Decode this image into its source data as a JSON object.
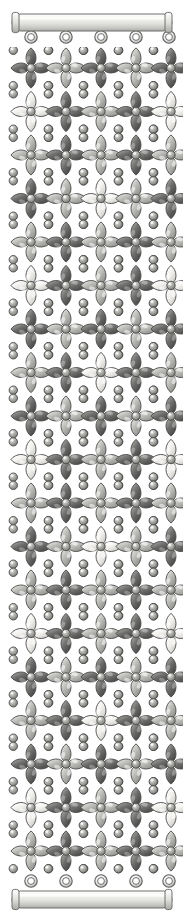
{
  "figure": {
    "background_color": "#ffffff",
    "canvas": {
      "width": 183,
      "height": 922
    }
  },
  "clasp": {
    "type": "tube-bar-clasp",
    "count": 2,
    "positions": [
      "top",
      "bottom"
    ],
    "bar": {
      "label": "clasp-bar",
      "x": 12,
      "width": 160,
      "height": 17,
      "top_y": 14,
      "bottom_y": 891,
      "fill_light": "#f4f4f2",
      "fill_mid": "#dcdcd8",
      "fill_shadow": "#b8b8b4",
      "stroke": "#6f6f6f",
      "end_cap_width": 7
    },
    "rings": {
      "label": "clasp-loop-ring",
      "count": 5,
      "outer_radius": 6.2,
      "inner_radius": 3.4,
      "stroke": "#5f5f5f",
      "fill": "#e9e9e6",
      "x_positions": [
        31,
        66,
        101,
        136,
        169
      ],
      "top_y": 37,
      "bottom_y": 881
    }
  },
  "band": {
    "label": "beadwork-band",
    "top_y": 48,
    "bottom_y": 874,
    "columns": 5,
    "rows": 19,
    "column_pitch": 35,
    "row_pitch": 43.5,
    "first_column_x": 31,
    "first_row_y": 68
  },
  "cluster": {
    "label": "bead-cluster",
    "structure": "four-diamond-rosette",
    "petals_per_cluster": 4,
    "petal_shape": "rounded-rhombus",
    "petal_radius": 12.5,
    "petal_offset": 8.2,
    "center_bead_radius": 4.2,
    "corner_bead_radius": 4.2,
    "stroke": "#4a4a4a",
    "stroke_width": 0.9
  },
  "palette": {
    "light_bead_fill": "#f0efec",
    "light_bead_hilite": "#ffffff",
    "light_bead_shade": "#cfcecb",
    "mid_bead_fill": "#b9b9b6",
    "mid_bead_hilite": "#e4e4e1",
    "mid_bead_shade": "#8e8e8b",
    "dark_bead_fill": "#6e6e6c",
    "dark_bead_hilite": "#a9a9a6",
    "dark_bead_shade": "#474746",
    "seed_bead_fill": "#a3a3a0",
    "seed_bead_stroke": "#4a4a4a",
    "outline": "#4a4a4a"
  },
  "pattern": {
    "description": "Alternating light and dark bead rosettes in a checkerboard rhythm across 5 columns.",
    "row_sequence": [
      [
        "dark",
        "mid",
        "dark",
        "mid",
        "dark"
      ],
      [
        "light",
        "dark",
        "mid",
        "dark",
        "light"
      ],
      [
        "mid",
        "dark",
        "mid",
        "dark",
        "mid"
      ],
      [
        "dark",
        "mid",
        "light",
        "mid",
        "dark"
      ],
      [
        "mid",
        "dark",
        "mid",
        "dark",
        "mid"
      ],
      [
        "light",
        "dark",
        "mid",
        "dark",
        "light"
      ],
      [
        "dark",
        "mid",
        "dark",
        "mid",
        "dark"
      ],
      [
        "mid",
        "dark",
        "light",
        "dark",
        "mid"
      ],
      [
        "dark",
        "mid",
        "dark",
        "mid",
        "dark"
      ],
      [
        "light",
        "dark",
        "mid",
        "dark",
        "light"
      ],
      [
        "mid",
        "dark",
        "mid",
        "dark",
        "mid"
      ],
      [
        "dark",
        "mid",
        "light",
        "mid",
        "dark"
      ],
      [
        "mid",
        "dark",
        "mid",
        "dark",
        "mid"
      ],
      [
        "light",
        "dark",
        "mid",
        "dark",
        "light"
      ],
      [
        "dark",
        "mid",
        "dark",
        "mid",
        "dark"
      ],
      [
        "mid",
        "dark",
        "light",
        "dark",
        "mid"
      ],
      [
        "dark",
        "mid",
        "dark",
        "mid",
        "dark"
      ],
      [
        "light",
        "dark",
        "mid",
        "dark",
        "light"
      ],
      [
        "mid",
        "dark",
        "mid",
        "dark",
        "mid"
      ]
    ]
  }
}
